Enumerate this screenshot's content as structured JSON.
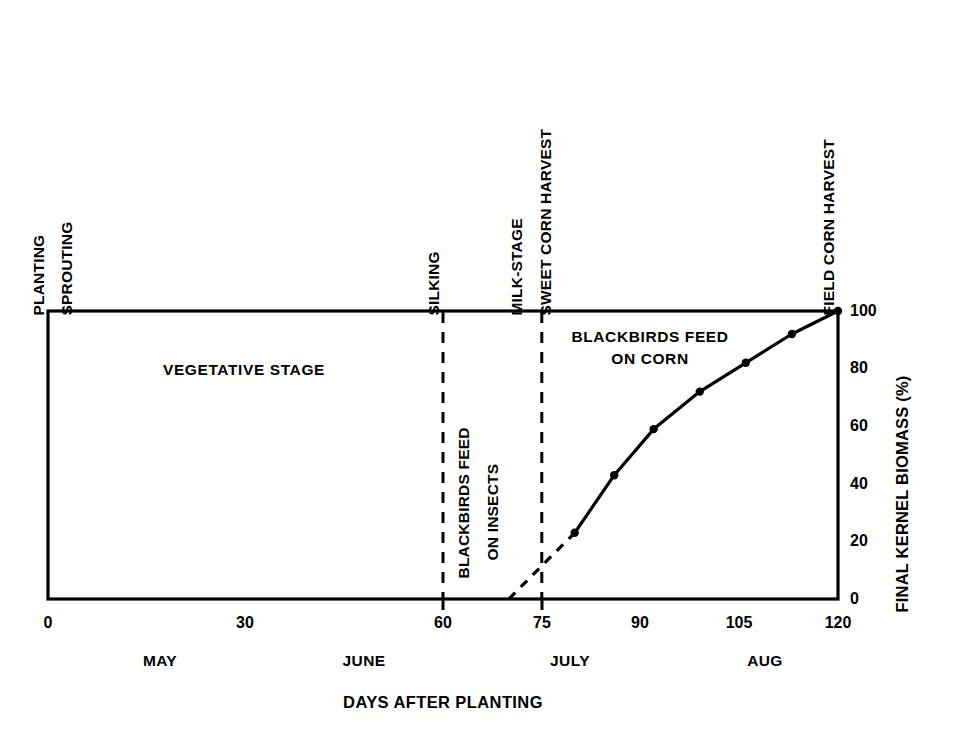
{
  "chart_data": {
    "type": "line",
    "title": "",
    "xlabel": "DAYS AFTER PLANTING",
    "ylabel": "FINAL KERNEL BIOMASS (%)",
    "xlim": [
      0,
      120
    ],
    "ylim": [
      0,
      100
    ],
    "grid": false,
    "legend": "none",
    "x_ticks": [
      "0",
      "30",
      "60",
      "75",
      "90",
      "105",
      "120"
    ],
    "x_tick_values": [
      0,
      30,
      60,
      75,
      90,
      105,
      120
    ],
    "y_ticks": [
      "0",
      "20",
      "40",
      "60",
      "80",
      "100"
    ],
    "y_tick_values": [
      0,
      20,
      40,
      60,
      80,
      100
    ],
    "month_labels": [
      {
        "text": "MAY",
        "x": 17
      },
      {
        "text": "JUNE",
        "x": 48
      },
      {
        "text": "JULY",
        "x": 79
      },
      {
        "text": "AUG",
        "x": 108
      }
    ],
    "series": [
      {
        "name": "Final kernel biomass",
        "style": "solid-with-markers",
        "x": [
          80,
          86,
          92,
          99,
          106,
          113,
          120
        ],
        "values": [
          23,
          43,
          59,
          72,
          82,
          92,
          100
        ]
      },
      {
        "name": "Extrapolated kernel fill onset",
        "style": "dashed",
        "x": [
          70,
          80
        ],
        "values": [
          0,
          23
        ]
      }
    ],
    "event_lines": [
      {
        "label": "SILKING",
        "x": 60
      },
      {
        "label": "MILK-STAGE",
        "x": 75
      }
    ],
    "top_labels": [
      {
        "text": "PLANTING",
        "x": 0
      },
      {
        "text": "SPROUTING",
        "x": 5
      },
      {
        "text": "SILKING",
        "x": 60
      },
      {
        "text": "MILK-STAGE",
        "x": 75
      },
      {
        "text": "SWEET CORN HARVEST",
        "x": 79
      },
      {
        "text": "FIELD CORN HARVEST",
        "x": 120
      }
    ],
    "region_labels": [
      {
        "text": "VEGETATIVE STAGE",
        "orientation": "horizontal"
      },
      {
        "text": "BLACKBIRDS FEED",
        "orientation": "vertical"
      },
      {
        "text": "ON INSECTS",
        "orientation": "vertical"
      },
      {
        "text": "BLACKBIRDS FEED",
        "orientation": "horizontal"
      },
      {
        "text": "ON CORN",
        "orientation": "horizontal"
      }
    ],
    "colors": {
      "line": "#000000",
      "axis": "#000000",
      "background": "#ffffff"
    }
  },
  "labels": {
    "top_planting": "PLANTING",
    "top_sprouting": "SPROUTING",
    "top_silking": "SILKING",
    "top_milk_stage": "MILK-STAGE",
    "top_sweet_corn_harvest": "SWEET CORN HARVEST",
    "top_field_corn_harvest": "FIELD CORN HARVEST",
    "region_vegetative": "VEGETATIVE STAGE",
    "region_insects_line1": "BLACKBIRDS FEED",
    "region_insects_line2": "ON INSECTS",
    "region_corn_line1": "BLACKBIRDS FEED",
    "region_corn_line2": "ON CORN",
    "y_axis_title": "FINAL KERNEL BIOMASS (%)",
    "x_axis_title": "DAYS AFTER PLANTING",
    "x_tick_0": "0",
    "x_tick_30": "30",
    "x_tick_60": "60",
    "x_tick_75": "75",
    "x_tick_90": "90",
    "x_tick_105": "105",
    "x_tick_120": "120",
    "y_tick_0": "0",
    "y_tick_20": "20",
    "y_tick_40": "40",
    "y_tick_60": "60",
    "y_tick_80": "80",
    "y_tick_100": "100",
    "month_may": "MAY",
    "month_june": "JUNE",
    "month_july": "JULY",
    "month_aug": "AUG"
  }
}
